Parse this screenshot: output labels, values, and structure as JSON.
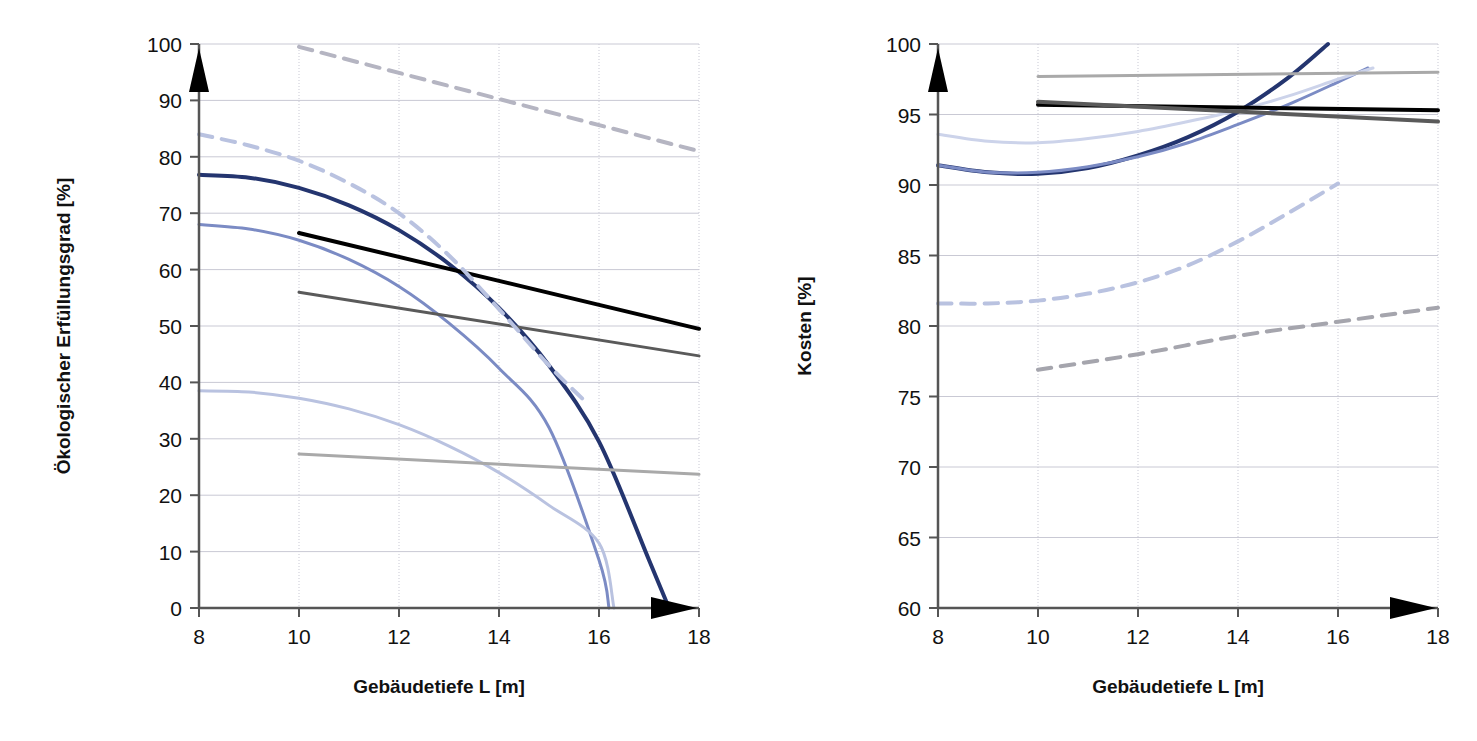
{
  "figure": {
    "panel_count": 2,
    "background": "#ffffff"
  },
  "colors": {
    "axis": "#555555",
    "grid": "#c9c9d4",
    "arrow": "#000000",
    "text": "#111111",
    "navy": "#24356f",
    "blue_mid": "#7b8bc4",
    "blue_light": "#b9c2e0",
    "blue_pale": "#ccd3ea",
    "black": "#000000",
    "gray_dark": "#5a5a5a",
    "gray_light": "#a9a9a9",
    "gray_mid": "#8e8e8e"
  },
  "left": {
    "ylabel": "Ökologischer Erfüllungsgrad [%]",
    "xlabel": "Gebäudetiefe L [m]",
    "y_ticks": [
      "0",
      "10",
      "20",
      "30",
      "40",
      "50",
      "60",
      "70",
      "80",
      "90",
      "100"
    ],
    "x_ticks": [
      "8",
      "10",
      "12",
      "14",
      "16",
      "18"
    ]
  },
  "right": {
    "ylabel": "Kosten [%]",
    "xlabel": "Gebäudetiefe L [m]",
    "y_ticks": [
      "60",
      "65",
      "70",
      "75",
      "80",
      "85",
      "90",
      "95",
      "100"
    ],
    "x_ticks": [
      "8",
      "10",
      "12",
      "14",
      "16",
      "18"
    ]
  },
  "chart_data": [
    {
      "type": "line",
      "panel": "left",
      "title": "",
      "xlabel": "Gebäudetiefe L [m]",
      "ylabel": "Ökologischer Erfüllungsgrad [%]",
      "xlim": [
        8,
        18
      ],
      "ylim": [
        0,
        100
      ],
      "xticks": [
        8,
        10,
        12,
        14,
        16,
        18
      ],
      "yticks": [
        0,
        10,
        20,
        30,
        40,
        50,
        60,
        70,
        80,
        90,
        100
      ],
      "grid": true,
      "legend": "none",
      "series": [
        {
          "name": "navy-solid-curve",
          "color": "#24356f",
          "style": "solid",
          "width": 4,
          "x": [
            8,
            9,
            10,
            11,
            12,
            13,
            14,
            15,
            16,
            17,
            17.4
          ],
          "y": [
            76.8,
            76.3,
            74.5,
            71.4,
            67.0,
            61.0,
            53.2,
            43.0,
            29.5,
            8.5,
            0.0
          ]
        },
        {
          "name": "blue-mid-solid-curve",
          "color": "#7b8bc4",
          "style": "solid",
          "width": 3,
          "x": [
            8,
            9,
            10,
            11,
            12,
            13,
            14,
            15,
            16,
            16.2
          ],
          "y": [
            68.0,
            67.2,
            65.2,
            61.8,
            57.0,
            50.5,
            42.5,
            32.0,
            8.5,
            0.0
          ]
        },
        {
          "name": "blue-pale-solid-curve",
          "color": "#b9c2e0",
          "style": "solid",
          "width": 3,
          "x": [
            8,
            9,
            10,
            11,
            12,
            13,
            14,
            15,
            16,
            16.3
          ],
          "y": [
            38.5,
            38.3,
            37.2,
            35.3,
            32.5,
            28.7,
            24.0,
            18.2,
            11.5,
            0.0
          ]
        },
        {
          "name": "black-straight-line",
          "color": "#000000",
          "style": "solid",
          "width": 4,
          "x": [
            10,
            18
          ],
          "y": [
            66.5,
            49.5
          ]
        },
        {
          "name": "gray-dark-straight-line",
          "color": "#5a5a5a",
          "style": "solid",
          "width": 3,
          "x": [
            10,
            18
          ],
          "y": [
            56.0,
            44.7
          ]
        },
        {
          "name": "gray-light-straight-line",
          "color": "#a9a9a9",
          "style": "solid",
          "width": 3,
          "x": [
            10,
            18
          ],
          "y": [
            27.3,
            23.7
          ]
        },
        {
          "name": "gray-dashed-upper-line",
          "color": "#b5b5c2",
          "style": "dashed",
          "width": 4,
          "x": [
            10,
            18
          ],
          "y": [
            99.5,
            81.0
          ]
        },
        {
          "name": "blue-dashed-curve",
          "color": "#b9c2e0",
          "style": "dashed",
          "width": 4,
          "x": [
            8,
            9,
            10,
            11,
            12,
            13,
            14,
            15,
            15.8
          ],
          "y": [
            84.0,
            82.0,
            79.3,
            75.3,
            70.0,
            62.5,
            53.0,
            43.0,
            36.0
          ]
        }
      ]
    },
    {
      "type": "line",
      "panel": "right",
      "title": "",
      "xlabel": "Gebäudetiefe L [m]",
      "ylabel": "Kosten [%]",
      "xlim": [
        8,
        18
      ],
      "ylim": [
        60,
        100
      ],
      "xticks": [
        8,
        10,
        12,
        14,
        16,
        18
      ],
      "yticks": [
        60,
        65,
        70,
        75,
        80,
        85,
        90,
        95,
        100
      ],
      "grid": true,
      "legend": "none",
      "series": [
        {
          "name": "navy-solid-u-curve",
          "color": "#24356f",
          "style": "solid",
          "width": 4,
          "x": [
            8,
            9,
            10,
            11,
            12,
            13,
            14,
            15,
            15.8
          ],
          "y": [
            91.4,
            90.9,
            90.8,
            91.2,
            92.1,
            93.4,
            95.2,
            97.6,
            100.0
          ]
        },
        {
          "name": "blue-mid-solid-u-curve",
          "color": "#7b8bc4",
          "style": "solid",
          "width": 3,
          "x": [
            8,
            9,
            10,
            11,
            12,
            13,
            14,
            15,
            16,
            16.6
          ],
          "y": [
            91.4,
            90.9,
            90.9,
            91.3,
            92.0,
            93.0,
            94.3,
            95.7,
            97.3,
            98.3
          ]
        },
        {
          "name": "blue-pale-solid-u-curve",
          "color": "#ccd3ea",
          "style": "solid",
          "width": 3,
          "x": [
            8,
            9,
            10,
            11,
            12,
            13,
            14,
            15,
            16,
            16.7
          ],
          "y": [
            93.6,
            93.1,
            93.0,
            93.3,
            93.8,
            94.5,
            95.3,
            96.3,
            97.5,
            98.3
          ]
        },
        {
          "name": "black-straight-line",
          "color": "#000000",
          "style": "solid",
          "width": 4,
          "x": [
            10,
            18
          ],
          "y": [
            95.7,
            95.3
          ]
        },
        {
          "name": "gray-dark-straight-line",
          "color": "#5a5a5a",
          "style": "solid",
          "width": 4,
          "x": [
            10,
            18
          ],
          "y": [
            95.9,
            94.5
          ]
        },
        {
          "name": "gray-light-straight-line",
          "color": "#a9a9a9",
          "style": "solid",
          "width": 3,
          "x": [
            10,
            18
          ],
          "y": [
            97.7,
            98.0
          ]
        },
        {
          "name": "blue-dashed-curve",
          "color": "#b9c2e0",
          "style": "dashed",
          "width": 4,
          "x": [
            8,
            9,
            10,
            11,
            12,
            13,
            14,
            15,
            16
          ],
          "y": [
            81.6,
            81.6,
            81.8,
            82.3,
            83.1,
            84.3,
            86.0,
            88.0,
            90.1
          ]
        },
        {
          "name": "gray-dashed-line",
          "color": "#a5a5ad",
          "style": "dashed",
          "width": 4,
          "x": [
            10,
            12,
            14,
            16,
            18
          ],
          "y": [
            76.9,
            78.0,
            79.3,
            80.3,
            81.3
          ]
        }
      ]
    }
  ]
}
